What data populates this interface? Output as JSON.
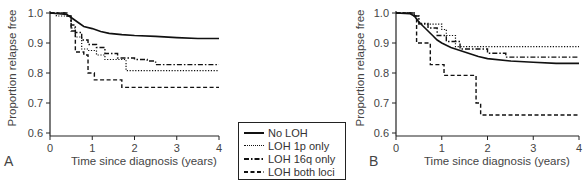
{
  "chart_data": [
    {
      "type": "line",
      "panel_label": "A",
      "title": "",
      "xlabel": "Time since diagnosis (years)",
      "ylabel": "Proportion relapse free",
      "xlim": [
        0,
        4
      ],
      "ylim": [
        0.6,
        1.0
      ],
      "xticks": [
        "0",
        "1",
        "2",
        "3",
        "4"
      ],
      "yticks": [
        "0.6",
        "0.7",
        "0.8",
        "0.9",
        "1.0"
      ],
      "grid": false,
      "series": [
        {
          "name": "No LOH",
          "style": "solid",
          "x": [
            0,
            0.4,
            0.5,
            0.6,
            0.7,
            0.8,
            1.0,
            1.2,
            1.4,
            1.7,
            2.0,
            2.5,
            3.0,
            3.5,
            4.0
          ],
          "y": [
            1.0,
            0.995,
            0.985,
            0.975,
            0.965,
            0.955,
            0.948,
            0.938,
            0.932,
            0.928,
            0.925,
            0.922,
            0.918,
            0.915,
            0.915
          ]
        },
        {
          "name": "LOH 1p only",
          "style": "dotted",
          "x": [
            0,
            0.15,
            0.4,
            0.5,
            0.6,
            0.75,
            0.9,
            1.1,
            1.3,
            1.75,
            1.8,
            4.0
          ],
          "y": [
            1.0,
            0.99,
            0.99,
            0.95,
            0.92,
            0.88,
            0.875,
            0.86,
            0.845,
            0.845,
            0.808,
            0.808
          ],
          "step": true
        },
        {
          "name": "LOH 16q only",
          "style": "dashdot",
          "x": [
            0,
            0.4,
            0.5,
            0.6,
            0.75,
            0.9,
            1.1,
            1.3,
            1.6,
            2.0,
            2.3,
            2.5,
            4.0
          ],
          "y": [
            1.0,
            0.99,
            0.96,
            0.935,
            0.91,
            0.895,
            0.885,
            0.865,
            0.85,
            0.845,
            0.84,
            0.828,
            0.828
          ],
          "step": true
        },
        {
          "name": "LOH both loci",
          "style": "dashed",
          "x": [
            0,
            0.4,
            0.5,
            0.6,
            0.8,
            0.9,
            1.05,
            1.7,
            4.0
          ],
          "y": [
            1.0,
            0.99,
            0.94,
            0.87,
            0.86,
            0.8,
            0.777,
            0.752,
            0.752
          ],
          "step": true
        }
      ]
    },
    {
      "type": "line",
      "panel_label": "B",
      "title": "",
      "xlabel": "Time since diagnosis (years)",
      "ylabel": "Proportion relapse free",
      "xlim": [
        0,
        4
      ],
      "ylim": [
        0.6,
        1.0
      ],
      "xticks": [
        "0",
        "1",
        "2",
        "3",
        "4"
      ],
      "yticks": [
        "0.6",
        "0.7",
        "0.8",
        "0.9",
        "1.0"
      ],
      "grid": false,
      "series": [
        {
          "name": "No LOH",
          "style": "solid",
          "x": [
            0,
            0.3,
            0.4,
            0.5,
            0.6,
            0.7,
            0.8,
            0.9,
            1.0,
            1.2,
            1.4,
            1.6,
            1.8,
            2.0,
            2.5,
            3.0,
            3.5,
            4.0
          ],
          "y": [
            1.0,
            0.998,
            0.99,
            0.97,
            0.955,
            0.94,
            0.925,
            0.91,
            0.9,
            0.885,
            0.875,
            0.865,
            0.855,
            0.848,
            0.84,
            0.836,
            0.832,
            0.832
          ]
        },
        {
          "name": "LOH 1p only",
          "style": "dotted",
          "x": [
            0,
            0.4,
            0.5,
            0.9,
            1.0,
            1.1,
            1.3,
            4.0
          ],
          "y": [
            1.0,
            0.99,
            0.963,
            0.963,
            0.945,
            0.925,
            0.888,
            0.888
          ],
          "step": true
        },
        {
          "name": "LOH 16q only",
          "style": "dashdot",
          "x": [
            0,
            0.4,
            0.5,
            0.7,
            0.9,
            1.1,
            1.4,
            2.0,
            2.2,
            2.4,
            4.0
          ],
          "y": [
            1.0,
            0.99,
            0.965,
            0.95,
            0.925,
            0.905,
            0.88,
            0.866,
            0.866,
            0.853,
            0.853
          ],
          "step": true
        },
        {
          "name": "LOH both loci",
          "style": "dashed",
          "x": [
            0,
            0.4,
            0.45,
            0.75,
            1.05,
            1.7,
            1.75,
            1.85,
            4.0
          ],
          "y": [
            1.0,
            0.99,
            0.9,
            0.828,
            0.792,
            0.792,
            0.7,
            0.66,
            0.66
          ],
          "step": true
        }
      ]
    }
  ],
  "legend": {
    "items": [
      {
        "label": "No LOH",
        "style": "solid"
      },
      {
        "label": "LOH 1p only",
        "style": "dotted"
      },
      {
        "label": "LOH 16q only",
        "style": "dashdot"
      },
      {
        "label": "LOH both loci",
        "style": "dashed"
      }
    ]
  },
  "panels": {
    "a": {
      "label": "A",
      "ylabel": "Proportion relapse free",
      "xlabel": "Time since diagnosis (years)"
    },
    "b": {
      "label": "B",
      "ylabel": "Proportion relapse free",
      "xlabel": "Time since diagnosis (years)"
    }
  }
}
